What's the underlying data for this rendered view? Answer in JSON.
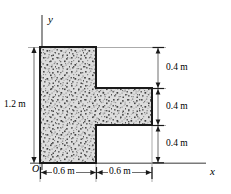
{
  "figure": {
    "kind": "engineering-cross-section-diagram",
    "shape_name": "tee-section",
    "axes": {
      "y_label": "y",
      "x_label": "x",
      "origin_label": "O"
    },
    "dimensions": {
      "left_vertical": "1.2 m",
      "right_vertical_top": "0.4 m",
      "right_vertical_middle": "0.4 m",
      "right_vertical_bottom": "0.4 m",
      "bottom_left_horizontal": "0.6 m",
      "bottom_right_horizontal": "0.6 m"
    },
    "colors": {
      "outline": "#1a1a1a",
      "fill_base": "#dcdcdc",
      "speckle_dark": "#4a4a4a",
      "speckle_mid": "#8f8f8f",
      "dimension_line": "#6e6e6e",
      "axis_line": "#7a7a7a",
      "extension_line": "#9a9a9a",
      "background": "#ffffff"
    },
    "geometry_px": {
      "stem_x0": 40,
      "stem_x1": 96,
      "shape_y_top": 47,
      "shape_y_bottom": 163,
      "arm_x1": 152,
      "arm_y_top": 88,
      "arm_y_bottom": 125
    }
  }
}
